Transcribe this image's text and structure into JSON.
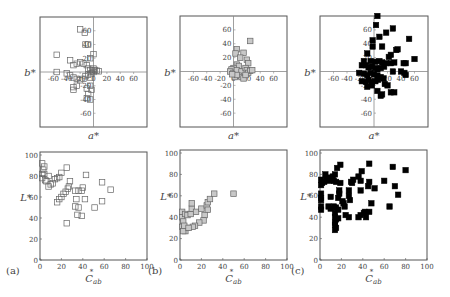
{
  "figure": {
    "panel_labels": [
      "(a)",
      "(b)",
      "(c)"
    ],
    "colors": {
      "frame": "#555555",
      "axis": "#888888",
      "text": "#444444",
      "marker_open_fill": "#ffffff",
      "marker_open_stroke": "#666666",
      "marker_gray_fill": "#c8c8c8",
      "marker_gray_stroke": "#666666",
      "marker_black_fill": "#000000"
    }
  },
  "chart_data": [
    {
      "id": "a-top",
      "panel": "(a)",
      "type": "scatter",
      "xlabel": "a*",
      "ylabel": "b*",
      "xlim": [
        -80,
        80
      ],
      "ylim": [
        -80,
        80
      ],
      "xticks": [
        -60,
        -40,
        -20,
        0,
        20,
        40,
        60
      ],
      "yticks": [
        -60,
        -40,
        -20,
        20,
        40,
        60
      ],
      "marker": "open",
      "points": [
        [
          -20,
          62
        ],
        [
          -13,
          57
        ],
        [
          -12,
          40
        ],
        [
          -8,
          40
        ],
        [
          -5,
          20
        ],
        [
          0,
          26
        ],
        [
          -55,
          25
        ],
        [
          -35,
          17
        ],
        [
          -30,
          10
        ],
        [
          -25,
          12
        ],
        [
          -20,
          14
        ],
        [
          -15,
          12
        ],
        [
          -10,
          10
        ],
        [
          -8,
          5
        ],
        [
          -5,
          3
        ],
        [
          -2,
          2
        ],
        [
          0,
          5
        ],
        [
          2,
          3
        ],
        [
          5,
          2
        ],
        [
          8,
          1
        ],
        [
          -55,
          0
        ],
        [
          -40,
          -2
        ],
        [
          -35,
          -5
        ],
        [
          -30,
          -8
        ],
        [
          -25,
          -10
        ],
        [
          -20,
          -12
        ],
        [
          -15,
          -10
        ],
        [
          -12,
          -6
        ],
        [
          -8,
          -4
        ],
        [
          -5,
          -8
        ],
        [
          -3,
          -2
        ],
        [
          0,
          0
        ],
        [
          -25,
          -20
        ],
        [
          -30,
          -22
        ],
        [
          -30,
          -26
        ],
        [
          -10,
          -24
        ],
        [
          -5,
          -20
        ],
        [
          -3,
          -26
        ],
        [
          -8,
          -32
        ],
        [
          -5,
          -40
        ],
        [
          -10,
          -38
        ]
      ]
    },
    {
      "id": "b-top",
      "panel": "(b)",
      "type": "scatter",
      "xlabel": "a*",
      "ylabel": "b*",
      "xlim": [
        -80,
        80
      ],
      "ylim": [
        -80,
        80
      ],
      "xticks": [
        -60,
        -40,
        -20,
        0,
        20,
        40,
        60
      ],
      "yticks": [
        -60,
        -40,
        -20,
        20,
        40,
        60
      ],
      "marker": "gray",
      "points": [
        [
          25,
          44
        ],
        [
          5,
          32
        ],
        [
          3,
          26
        ],
        [
          15,
          27
        ],
        [
          10,
          20
        ],
        [
          20,
          17
        ],
        [
          22,
          12
        ],
        [
          5,
          10
        ],
        [
          8,
          8
        ],
        [
          0,
          5
        ],
        [
          -3,
          3
        ],
        [
          -5,
          0
        ],
        [
          0,
          -2
        ],
        [
          3,
          -3
        ],
        [
          5,
          2
        ],
        [
          12,
          0
        ],
        [
          18,
          5
        ],
        [
          20,
          2
        ],
        [
          22,
          -2
        ],
        [
          25,
          1
        ],
        [
          28,
          2
        ],
        [
          8,
          -6
        ],
        [
          12,
          -8
        ],
        [
          15,
          -10
        ],
        [
          18,
          -5
        ],
        [
          2,
          -8
        ],
        [
          5,
          -5
        ],
        [
          -2,
          -4
        ]
      ]
    },
    {
      "id": "c-top",
      "panel": "(c)",
      "type": "scatter",
      "xlabel": "a*",
      "ylabel": "b*",
      "xlim": [
        -80,
        80
      ],
      "ylim": [
        -80,
        80
      ],
      "xticks": [
        -60,
        -40,
        -20,
        0,
        20,
        40,
        60
      ],
      "yticks": [
        -60,
        -40,
        -20,
        20,
        40,
        60
      ],
      "marker": "black",
      "points": [
        [
          5,
          80
        ],
        [
          3,
          67
        ],
        [
          28,
          62
        ],
        [
          18,
          56
        ],
        [
          8,
          50
        ],
        [
          -2,
          45
        ],
        [
          52,
          47
        ],
        [
          -2,
          36
        ],
        [
          12,
          36
        ],
        [
          35,
          32
        ],
        [
          33,
          31
        ],
        [
          -10,
          26
        ],
        [
          25,
          24
        ],
        [
          22,
          21
        ],
        [
          60,
          18
        ],
        [
          -15,
          15
        ],
        [
          -5,
          15
        ],
        [
          2,
          14
        ],
        [
          8,
          15
        ],
        [
          12,
          13
        ],
        [
          18,
          12
        ],
        [
          25,
          12
        ],
        [
          30,
          13
        ],
        [
          44,
          12
        ],
        [
          47,
          12
        ],
        [
          -18,
          9
        ],
        [
          -12,
          9
        ],
        [
          -8,
          6
        ],
        [
          -3,
          7
        ],
        [
          2,
          5
        ],
        [
          5,
          3
        ],
        [
          10,
          5
        ],
        [
          15,
          7
        ],
        [
          -22,
          -2
        ],
        [
          -15,
          -3
        ],
        [
          -10,
          -5
        ],
        [
          -5,
          -2
        ],
        [
          0,
          -4
        ],
        [
          5,
          -6
        ],
        [
          10,
          -8
        ],
        [
          28,
          0
        ],
        [
          40,
          0
        ],
        [
          45,
          -2
        ],
        [
          47,
          -5
        ],
        [
          -18,
          -14
        ],
        [
          -12,
          -15
        ],
        [
          -8,
          -12
        ],
        [
          -3,
          -15
        ],
        [
          2,
          -14
        ],
        [
          6,
          -12
        ],
        [
          14,
          -10
        ],
        [
          16,
          -18
        ],
        [
          20,
          -20
        ],
        [
          -10,
          -22
        ],
        [
          5,
          -28
        ],
        [
          10,
          -35
        ],
        [
          12,
          -33
        ],
        [
          25,
          -30
        ],
        [
          30,
          -30
        ],
        [
          -3,
          -20
        ]
      ]
    },
    {
      "id": "a-bottom",
      "panel": "(a)",
      "type": "scatter",
      "xlabel": "C*ab",
      "ylabel": "L*",
      "xlim": [
        0,
        100
      ],
      "ylim": [
        0,
        100
      ],
      "xticks": [
        0,
        20,
        40,
        60,
        80,
        100
      ],
      "yticks": [
        0,
        20,
        40,
        60,
        80,
        100
      ],
      "marker": "open",
      "points": [
        [
          2,
          92
        ],
        [
          4,
          89
        ],
        [
          3,
          86
        ],
        [
          2,
          82
        ],
        [
          4,
          82
        ],
        [
          2,
          78
        ],
        [
          6,
          75
        ],
        [
          8,
          80
        ],
        [
          10,
          72
        ],
        [
          12,
          73
        ],
        [
          14,
          77
        ],
        [
          16,
          78
        ],
        [
          20,
          83
        ],
        [
          25,
          88
        ],
        [
          18,
          79
        ],
        [
          28,
          75
        ],
        [
          27,
          70
        ],
        [
          26,
          68
        ],
        [
          24,
          65
        ],
        [
          22,
          63
        ],
        [
          20,
          60
        ],
        [
          18,
          58
        ],
        [
          16,
          55
        ],
        [
          33,
          66
        ],
        [
          36,
          66
        ],
        [
          39,
          66
        ],
        [
          40,
          69
        ],
        [
          43,
          81
        ],
        [
          42,
          58
        ],
        [
          34,
          58
        ],
        [
          33,
          51
        ],
        [
          36,
          50
        ],
        [
          35,
          43
        ],
        [
          39,
          42
        ],
        [
          51,
          50
        ],
        [
          58,
          74
        ],
        [
          58,
          56
        ],
        [
          66,
          67
        ],
        [
          25,
          35
        ],
        [
          8,
          70
        ],
        [
          5,
          76
        ]
      ]
    },
    {
      "id": "b-bottom",
      "panel": "(b)",
      "type": "scatter",
      "xlabel": "C*ab",
      "ylabel": "L*",
      "xlim": [
        0,
        100
      ],
      "ylim": [
        0,
        100
      ],
      "xticks": [
        0,
        20,
        40,
        60,
        80,
        100
      ],
      "yticks": [
        0,
        20,
        40,
        60,
        80,
        100
      ],
      "marker": "gray",
      "points": [
        [
          2,
          45
        ],
        [
          2,
          40
        ],
        [
          3,
          36
        ],
        [
          2,
          31
        ],
        [
          4,
          29
        ],
        [
          5,
          27
        ],
        [
          6,
          30
        ],
        [
          4,
          32
        ],
        [
          5,
          43
        ],
        [
          7,
          42
        ],
        [
          10,
          43
        ],
        [
          11,
          48
        ],
        [
          11,
          53
        ],
        [
          15,
          45
        ],
        [
          20,
          48
        ],
        [
          25,
          51
        ],
        [
          26,
          54
        ],
        [
          28,
          57
        ],
        [
          32,
          62
        ],
        [
          50,
          62
        ],
        [
          26,
          47
        ],
        [
          23,
          42
        ],
        [
          22,
          37
        ],
        [
          18,
          35
        ],
        [
          14,
          32
        ],
        [
          12,
          31
        ],
        [
          3,
          27
        ],
        [
          8,
          30
        ]
      ]
    },
    {
      "id": "c-bottom",
      "panel": "(c)",
      "type": "scatter",
      "xlabel": "C*ab",
      "ylabel": "L*",
      "xlim": [
        0,
        100
      ],
      "ylim": [
        0,
        100
      ],
      "xticks": [
        0,
        20,
        40,
        60,
        80,
        100
      ],
      "yticks": [
        0,
        20,
        40,
        60,
        80,
        100
      ],
      "marker": "black",
      "points": [
        [
          1,
          75
        ],
        [
          2,
          72
        ],
        [
          1,
          70
        ],
        [
          4,
          73
        ],
        [
          5,
          80
        ],
        [
          6,
          75
        ],
        [
          8,
          77
        ],
        [
          9,
          74
        ],
        [
          10,
          76
        ],
        [
          12,
          78
        ],
        [
          14,
          80
        ],
        [
          15,
          73
        ],
        [
          16,
          86
        ],
        [
          19,
          89
        ],
        [
          19,
          72
        ],
        [
          13,
          74
        ],
        [
          1,
          62
        ],
        [
          1,
          58
        ],
        [
          1,
          56
        ],
        [
          1,
          50
        ],
        [
          1,
          47
        ],
        [
          10,
          59
        ],
        [
          8,
          50
        ],
        [
          10,
          48
        ],
        [
          13,
          50
        ],
        [
          15,
          49
        ],
        [
          17,
          47
        ],
        [
          17,
          58
        ],
        [
          18,
          65
        ],
        [
          18,
          62
        ],
        [
          21,
          55
        ],
        [
          22,
          53
        ],
        [
          23,
          50
        ],
        [
          24,
          42
        ],
        [
          27,
          40
        ],
        [
          14,
          44
        ],
        [
          14,
          40
        ],
        [
          15,
          38
        ],
        [
          14,
          35
        ],
        [
          14,
          33
        ],
        [
          15,
          30
        ],
        [
          14,
          28
        ],
        [
          17,
          39
        ],
        [
          27,
          65
        ],
        [
          27,
          60
        ],
        [
          28,
          56
        ],
        [
          29,
          73
        ],
        [
          31,
          75
        ],
        [
          30,
          72
        ],
        [
          36,
          78
        ],
        [
          38,
          74
        ],
        [
          38,
          65
        ],
        [
          39,
          83
        ],
        [
          36,
          40
        ],
        [
          38,
          42
        ],
        [
          41,
          44
        ],
        [
          42,
          45
        ],
        [
          43,
          40
        ],
        [
          46,
          45
        ],
        [
          45,
          69
        ],
        [
          46,
          73
        ],
        [
          48,
          53
        ],
        [
          46,
          90
        ],
        [
          51,
          67
        ],
        [
          60,
          74
        ],
        [
          65,
          50
        ],
        [
          68,
          87
        ],
        [
          70,
          69
        ],
        [
          73,
          61
        ],
        [
          80,
          84
        ]
      ]
    }
  ]
}
